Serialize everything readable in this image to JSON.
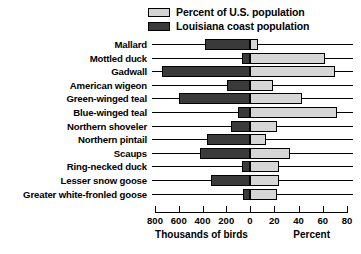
{
  "chart_data": {
    "type": "bar",
    "orientation": "horizontal-bidirectional",
    "title": "",
    "legend": {
      "position": "top-right",
      "entries": [
        {
          "label": "Percent of U.S. population",
          "swatch": "light-gray-swatch",
          "color": "#d3d3d3"
        },
        {
          "label": "Louisiana coast population",
          "swatch": "dark-gray-swatch",
          "color": "#3a3a3a"
        }
      ]
    },
    "categories": [
      "Mallard",
      "Mottled duck",
      "Gadwall",
      "American wigeon",
      "Green-winged teal",
      "Blue-winged teal",
      "Northern shoveler",
      "Northern pintail",
      "Scaups",
      "Ring-necked duck",
      "Lesser snow goose",
      "Greater white-fronled goose"
    ],
    "series": [
      {
        "name": "Louisiana coast population",
        "units": "Thousands of birds",
        "direction": "left",
        "axis": "left",
        "values": [
          380,
          65,
          745,
          195,
          600,
          100,
          160,
          360,
          420,
          65,
          330,
          60
        ]
      },
      {
        "name": "Percent of U.S. population",
        "units": "Percent",
        "direction": "right",
        "axis": "right",
        "values": [
          7,
          62,
          70,
          19,
          43,
          72,
          22,
          13,
          33,
          24,
          24,
          22
        ]
      }
    ],
    "axes": {
      "left": {
        "label": "Thousands of birds",
        "ticks": [
          800,
          600,
          400,
          200,
          0
        ],
        "tick_labels": [
          "800",
          "600",
          "400",
          "200",
          "0"
        ],
        "range": [
          800,
          0
        ]
      },
      "right": {
        "label": "Percent",
        "ticks": [
          0,
          20,
          40,
          60,
          80
        ],
        "tick_labels": [
          "0",
          "20",
          "40",
          "60",
          "80"
        ],
        "range": [
          0,
          80
        ]
      },
      "grid": false
    }
  }
}
